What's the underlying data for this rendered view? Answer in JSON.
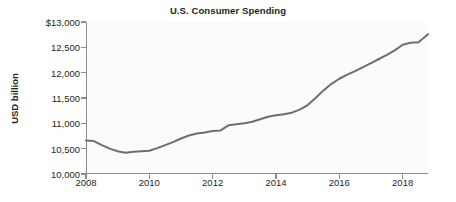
{
  "chart_data": {
    "type": "line",
    "title": "U.S. Consumer Spending",
    "xlabel": "",
    "ylabel": "USD billion",
    "xlim": [
      2008.0,
      2018.8
    ],
    "ylim": [
      10000,
      13000
    ],
    "xticks": [
      2008,
      2010,
      2012,
      2014,
      2016,
      2018
    ],
    "xtick_labels": [
      "2008",
      "2010",
      "2012",
      "2014",
      "2016",
      "2018"
    ],
    "yticks": [
      10000,
      10500,
      11000,
      11500,
      12000,
      12500,
      13000
    ],
    "ytick_labels": [
      "10,000",
      "10,500",
      "11,000",
      "11,500",
      "12,000",
      "12,500",
      "$13,000"
    ],
    "grid": false,
    "legend": null,
    "line_color": "#6e6e6e",
    "line_width": 2.0,
    "series": [
      {
        "name": "U.S. Consumer Spending",
        "x": [
          2008.0,
          2008.25,
          2008.5,
          2008.75,
          2009.0,
          2009.25,
          2009.5,
          2009.75,
          2010.0,
          2010.25,
          2010.5,
          2010.75,
          2011.0,
          2011.25,
          2011.5,
          2011.75,
          2012.0,
          2012.25,
          2012.5,
          2012.75,
          2013.0,
          2013.25,
          2013.5,
          2013.75,
          2014.0,
          2014.25,
          2014.5,
          2014.75,
          2015.0,
          2015.25,
          2015.5,
          2015.75,
          2016.0,
          2016.25,
          2016.5,
          2016.75,
          2017.0,
          2017.25,
          2017.5,
          2017.75,
          2018.0,
          2018.25,
          2018.5,
          2018.8
        ],
        "y": [
          10660,
          10650,
          10570,
          10500,
          10450,
          10420,
          10440,
          10450,
          10460,
          10510,
          10570,
          10630,
          10700,
          10760,
          10800,
          10820,
          10850,
          10860,
          10960,
          10980,
          11000,
          11030,
          11080,
          11130,
          11160,
          11180,
          11210,
          11270,
          11360,
          11500,
          11650,
          11780,
          11880,
          11960,
          12030,
          12110,
          12190,
          12270,
          12350,
          12440,
          12550,
          12590,
          12600,
          12760
        ]
      }
    ]
  },
  "axes": {
    "y_title": "USD billion"
  }
}
